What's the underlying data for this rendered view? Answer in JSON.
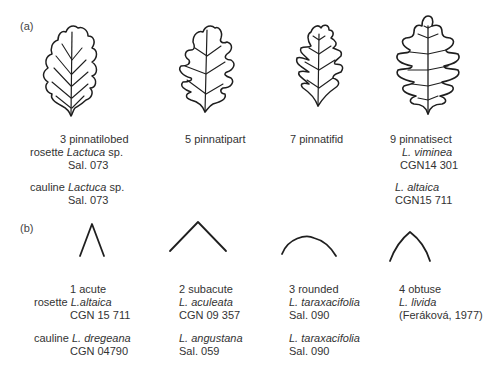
{
  "panel_a": {
    "label": "(a)",
    "leaves": [
      {
        "icon": "pinnatilobed-leaf-icon",
        "caption": "3 pinnatilobed",
        "rosette_prefix": "rosette ",
        "rosette_taxon": "Lactuca",
        "rosette_suffix": " sp.",
        "rosette_accession": "Sal. 073",
        "cauline_prefix": "cauline ",
        "cauline_taxon": "Lactuca",
        "cauline_suffix": " sp.",
        "cauline_accession": "Sal. 073"
      },
      {
        "icon": "pinnatipart-leaf-icon",
        "caption": "5 pinnatipart"
      },
      {
        "icon": "pinnatifid-leaf-icon",
        "caption": "7 pinnatifid"
      },
      {
        "icon": "pinnatisect-leaf-icon",
        "caption": "9 pinnatisect",
        "rosette_taxon": "L. viminea",
        "rosette_accession": "CGN14 301",
        "cauline_taxon": "L. altaica",
        "cauline_accession": "CGN15 711"
      }
    ]
  },
  "panel_b": {
    "label": "(b)",
    "apices": [
      {
        "icon": "acute-apex-icon",
        "caption": "1 acute",
        "rosette_prefix": "rosette ",
        "rosette_taxon": "L.altaica",
        "rosette_accession": "CGN 15 711",
        "cauline_prefix": "cauline ",
        "cauline_taxon": "L. dregeana",
        "cauline_accession": "CGN 04790"
      },
      {
        "icon": "subacute-apex-icon",
        "caption": "2 subacute",
        "rosette_taxon": "L. aculeata",
        "rosette_accession": "CGN 09 357",
        "cauline_taxon": "L. angustana",
        "cauline_accession": "Sal. 059"
      },
      {
        "icon": "rounded-apex-icon",
        "caption": "3 rounded",
        "rosette_taxon": "L. taraxacifolia",
        "rosette_accession": "Sal. 090",
        "cauline_taxon": "L. taraxacifolia",
        "cauline_accession": "Sal. 090"
      },
      {
        "icon": "obtuse-apex-icon",
        "caption": "4 obtuse",
        "rosette_taxon": "L. livida",
        "rosette_accession": "(Feráková, 1977)"
      }
    ]
  }
}
